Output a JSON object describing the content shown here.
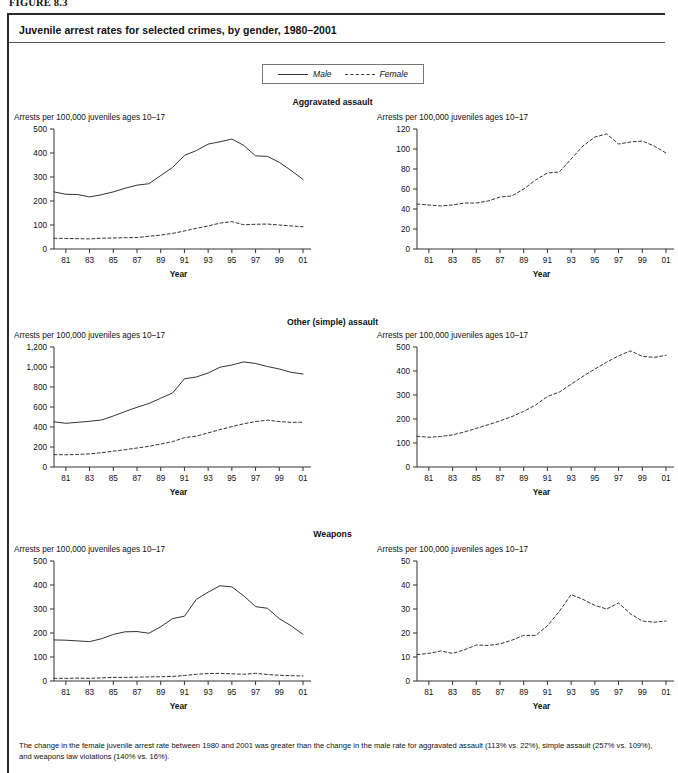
{
  "figure": {
    "label": "FIGURE 8.3",
    "title": "Juvenile arrest rates for selected crimes, by gender, 1980–2001",
    "footnote": "The change in the female juvenile arrest rate between 1980 and 2001 was greater than the change in the male rate for aggravated assault (113% vs. 22%), simple assault (257% vs. 109%), and weapons law violations (140% vs. 16%)."
  },
  "legend": {
    "male_label": "Male",
    "female_label": "Female",
    "male_style": "solid",
    "female_style": "dashed",
    "line_color": "#333333"
  },
  "axis_caption": "Arrests per 100,000 juveniles ages 10–17",
  "x_title": "Year",
  "x_ticklabels": [
    "81",
    "83",
    "85",
    "87",
    "89",
    "91",
    "93",
    "95",
    "97",
    "99",
    "01"
  ],
  "sections": [
    {
      "title": "Aggravated assault"
    },
    {
      "title": "Other (simple) assault"
    },
    {
      "title": "Weapons"
    }
  ],
  "chart_data": [
    {
      "type": "line",
      "title": "Aggravated assault",
      "panel": "left",
      "xlabel": "Year",
      "ylabel": "Arrests per 100,000 juveniles ages 10–17",
      "x": [
        1980,
        1981,
        1982,
        1983,
        1984,
        1985,
        1986,
        1987,
        1988,
        1989,
        1990,
        1991,
        1992,
        1993,
        1994,
        1995,
        1996,
        1997,
        1998,
        1999,
        2000,
        2001
      ],
      "xtick_values": [
        1981,
        1983,
        1985,
        1987,
        1989,
        1991,
        1993,
        1995,
        1997,
        1999,
        2001
      ],
      "xtick_labels": [
        "81",
        "83",
        "85",
        "87",
        "89",
        "91",
        "93",
        "95",
        "97",
        "99",
        "01"
      ],
      "ylim": [
        0,
        500
      ],
      "yticks": [
        0,
        100,
        200,
        300,
        400,
        500
      ],
      "ytick_labels": [
        "0",
        "100",
        "200",
        "300",
        "400",
        "500"
      ],
      "grid": false,
      "series": [
        {
          "name": "Male",
          "style": "solid",
          "values": [
            238,
            228,
            227,
            217,
            226,
            238,
            253,
            266,
            272,
            306,
            340,
            390,
            410,
            437,
            447,
            458,
            432,
            388,
            386,
            361,
            327,
            290
          ]
        },
        {
          "name": "Female",
          "style": "dashed",
          "values": [
            45,
            44,
            43,
            42,
            45,
            46,
            47,
            48,
            53,
            58,
            65,
            75,
            86,
            96,
            108,
            114,
            101,
            103,
            104,
            100,
            96,
            93
          ]
        }
      ]
    },
    {
      "type": "line",
      "title": "Aggravated assault",
      "panel": "right",
      "xlabel": "Year",
      "ylabel": "Arrests per 100,000 juveniles ages 10–17",
      "x": [
        1980,
        1981,
        1982,
        1983,
        1984,
        1985,
        1986,
        1987,
        1988,
        1989,
        1990,
        1991,
        1992,
        1993,
        1994,
        1995,
        1996,
        1997,
        1998,
        1999,
        2000,
        2001
      ],
      "xtick_values": [
        1981,
        1983,
        1985,
        1987,
        1989,
        1991,
        1993,
        1995,
        1997,
        1999,
        2001
      ],
      "xtick_labels": [
        "81",
        "83",
        "85",
        "87",
        "89",
        "91",
        "93",
        "95",
        "97",
        "99",
        "01"
      ],
      "ylim": [
        0,
        120
      ],
      "yticks": [
        0,
        20,
        40,
        60,
        80,
        100,
        120
      ],
      "ytick_labels": [
        "0",
        "20",
        "40",
        "60",
        "80",
        "100",
        "120"
      ],
      "grid": false,
      "series": [
        {
          "name": "Female",
          "style": "dashed",
          "values": [
            45,
            44,
            43,
            44,
            46,
            46,
            48,
            52,
            53,
            60,
            69,
            76,
            77,
            90,
            103,
            112,
            115,
            105,
            107,
            108,
            103,
            96
          ]
        }
      ]
    },
    {
      "type": "line",
      "title": "Other (simple) assault",
      "panel": "left",
      "xlabel": "Year",
      "ylabel": "Arrests per 100,000 juveniles ages 10–17",
      "x": [
        1980,
        1981,
        1982,
        1983,
        1984,
        1985,
        1986,
        1987,
        1988,
        1989,
        1990,
        1991,
        1992,
        1993,
        1994,
        1995,
        1996,
        1997,
        1998,
        1999,
        2000,
        2001
      ],
      "xtick_values": [
        1981,
        1983,
        1985,
        1987,
        1989,
        1991,
        1993,
        1995,
        1997,
        1999,
        2001
      ],
      "xtick_labels": [
        "81",
        "83",
        "85",
        "87",
        "89",
        "91",
        "93",
        "95",
        "97",
        "99",
        "01"
      ],
      "ylim": [
        0,
        1200
      ],
      "yticks": [
        0,
        200,
        400,
        600,
        800,
        1000,
        1200
      ],
      "ytick_labels": [
        "0",
        "200",
        "400",
        "600",
        "800",
        "1,000",
        "1,200"
      ],
      "grid": false,
      "series": [
        {
          "name": "Male",
          "style": "solid",
          "values": [
            452,
            437,
            447,
            457,
            470,
            510,
            555,
            597,
            635,
            688,
            740,
            882,
            900,
            940,
            998,
            1020,
            1051,
            1035,
            1005,
            980,
            947,
            930
          ]
        },
        {
          "name": "Female",
          "style": "dashed",
          "values": [
            124,
            122,
            126,
            131,
            143,
            158,
            173,
            190,
            207,
            230,
            254,
            293,
            309,
            341,
            374,
            404,
            432,
            455,
            468,
            455,
            446,
            448
          ]
        }
      ]
    },
    {
      "type": "line",
      "title": "Other (simple) assault",
      "panel": "right",
      "xlabel": "Year",
      "ylabel": "Arrests per 100,000 juveniles ages 10–17",
      "x": [
        1980,
        1981,
        1982,
        1983,
        1984,
        1985,
        1986,
        1987,
        1988,
        1989,
        1990,
        1991,
        1992,
        1993,
        1994,
        1995,
        1996,
        1997,
        1998,
        1999,
        2000,
        2001
      ],
      "xtick_values": [
        1981,
        1983,
        1985,
        1987,
        1989,
        1991,
        1993,
        1995,
        1997,
        1999,
        2001
      ],
      "xtick_labels": [
        "81",
        "83",
        "85",
        "87",
        "89",
        "91",
        "93",
        "95",
        "97",
        "99",
        "01"
      ],
      "ylim": [
        0,
        500
      ],
      "yticks": [
        0,
        100,
        200,
        300,
        400,
        500
      ],
      "ytick_labels": [
        "0",
        "100",
        "200",
        "300",
        "400",
        "500"
      ],
      "grid": false,
      "series": [
        {
          "name": "Female",
          "style": "dashed",
          "values": [
            128,
            124,
            127,
            134,
            146,
            161,
            176,
            192,
            210,
            232,
            258,
            294,
            312,
            345,
            378,
            408,
            437,
            463,
            484,
            461,
            457,
            465
          ]
        }
      ]
    },
    {
      "type": "line",
      "title": "Weapons",
      "panel": "left",
      "xlabel": "Year",
      "ylabel": "Arrests per 100,000 juveniles ages 10–17",
      "x": [
        1980,
        1981,
        1982,
        1983,
        1984,
        1985,
        1986,
        1987,
        1988,
        1989,
        1990,
        1991,
        1992,
        1993,
        1994,
        1995,
        1996,
        1997,
        1998,
        1999,
        2000,
        2001
      ],
      "xtick_values": [
        1981,
        1983,
        1985,
        1987,
        1989,
        1991,
        1993,
        1995,
        1997,
        1999,
        2001
      ],
      "xtick_labels": [
        "81",
        "83",
        "85",
        "87",
        "89",
        "91",
        "93",
        "95",
        "97",
        "99",
        "01"
      ],
      "ylim": [
        0,
        500
      ],
      "yticks": [
        0,
        100,
        200,
        300,
        400,
        500
      ],
      "ytick_labels": [
        "0",
        "100",
        "200",
        "300",
        "400",
        "500"
      ],
      "grid": false,
      "series": [
        {
          "name": "Male",
          "style": "solid",
          "values": [
            171,
            170,
            167,
            164,
            176,
            194,
            205,
            206,
            199,
            226,
            260,
            270,
            340,
            370,
            397,
            392,
            355,
            310,
            303,
            260,
            230,
            194
          ]
        },
        {
          "name": "Female",
          "style": "dashed",
          "values": [
            11,
            11,
            12,
            11,
            13,
            15,
            15,
            16,
            17,
            18,
            19,
            23,
            28,
            31,
            32,
            30,
            28,
            32,
            27,
            24,
            22,
            21
          ]
        }
      ]
    },
    {
      "type": "line",
      "title": "Weapons",
      "panel": "right",
      "xlabel": "Year",
      "ylabel": "Arrests per 100,000 juveniles ages 10–17",
      "x": [
        1980,
        1981,
        1982,
        1983,
        1984,
        1985,
        1986,
        1987,
        1988,
        1989,
        1990,
        1991,
        1992,
        1993,
        1994,
        1995,
        1996,
        1997,
        1998,
        1999,
        2000,
        2001
      ],
      "xtick_values": [
        1981,
        1983,
        1985,
        1987,
        1989,
        1991,
        1993,
        1995,
        1997,
        1999,
        2001
      ],
      "xtick_labels": [
        "81",
        "83",
        "85",
        "87",
        "89",
        "91",
        "93",
        "95",
        "97",
        "99",
        "01"
      ],
      "ylim": [
        0,
        50
      ],
      "yticks": [
        0,
        10,
        20,
        30,
        40,
        50
      ],
      "ytick_labels": [
        "0",
        "10",
        "20",
        "30",
        "40",
        "50"
      ],
      "grid": false,
      "series": [
        {
          "name": "Female",
          "style": "dashed",
          "values": [
            11,
            11.5,
            12.5,
            11.5,
            13,
            15,
            14.8,
            15.5,
            17,
            19,
            19,
            23,
            29,
            36,
            34,
            31.5,
            30,
            32.5,
            28,
            25,
            24.5,
            25
          ]
        }
      ]
    }
  ]
}
